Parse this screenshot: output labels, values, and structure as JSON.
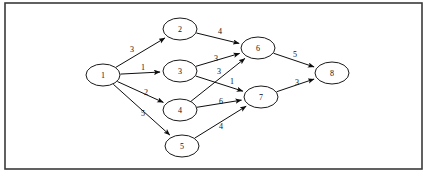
{
  "figure": {
    "background_color": "#ffffff",
    "frame": {
      "stroke_color": "#3a3a3a",
      "x": 5,
      "y": 3,
      "width": 417,
      "height": 166
    }
  },
  "chart_data": {
    "type": "diagram",
    "diagram_type": "directed-weighted-graph",
    "title": "",
    "node_shape": "ellipse",
    "node_radius_x": 17,
    "node_radius_y": 11,
    "edge_color": "#0d0d0d",
    "node_fill": "#ffffff",
    "node_stroke": "#1a1a1a",
    "nodes": [
      {
        "id": "1",
        "label": "1",
        "x": 103,
        "y": 75
      },
      {
        "id": "2",
        "label": "2",
        "x": 180,
        "y": 29
      },
      {
        "id": "3",
        "label": "3",
        "x": 180,
        "y": 71
      },
      {
        "id": "4",
        "label": "4",
        "x": 180,
        "y": 110
      },
      {
        "id": "5",
        "label": "5",
        "x": 182,
        "y": 146
      },
      {
        "id": "6",
        "label": "6",
        "x": 258,
        "y": 48
      },
      {
        "id": "7",
        "label": "7",
        "x": 261,
        "y": 97
      },
      {
        "id": "8",
        "label": "8",
        "x": 332,
        "y": 73
      }
    ],
    "edges": [
      {
        "from": "1",
        "to": "2",
        "weight": "3",
        "label_x": 132,
        "label_y": 49
      },
      {
        "from": "1",
        "to": "3",
        "weight": "1",
        "label_x": 143,
        "label_y": 67
      },
      {
        "from": "1",
        "to": "4",
        "weight": "2",
        "label_x": 146,
        "label_y": 92
      },
      {
        "from": "1",
        "to": "5",
        "weight": "5",
        "label_x": 143,
        "label_y": 113
      },
      {
        "from": "2",
        "to": "6",
        "weight": "4",
        "label_x": 220,
        "label_y": 31
      },
      {
        "from": "3",
        "to": "6",
        "weight": "3",
        "label_x": 216,
        "label_y": 58
      },
      {
        "from": "3",
        "to": "7",
        "weight": "1",
        "label_x": 232,
        "label_y": 81
      },
      {
        "from": "4",
        "to": "6",
        "weight": "3",
        "label_x": 219,
        "label_y": 71
      },
      {
        "from": "4",
        "to": "7",
        "weight": "6",
        "label_x": 221,
        "label_y": 101
      },
      {
        "from": "5",
        "to": "7",
        "weight": "4",
        "label_x": 221,
        "label_y": 126
      },
      {
        "from": "6",
        "to": "8",
        "weight": "5",
        "label_x": 295,
        "label_y": 54
      },
      {
        "from": "7",
        "to": "8",
        "weight": "3",
        "label_x": 297,
        "label_y": 82
      }
    ]
  }
}
